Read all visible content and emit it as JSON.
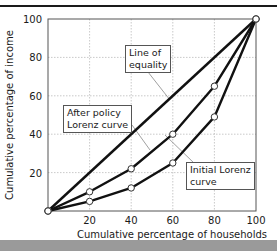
{
  "chart_data": {
    "type": "line",
    "title": "",
    "xlabel": "Cumulative percentage of households",
    "ylabel": "Cumulative percentage of income",
    "xlim": [
      0,
      100
    ],
    "ylim": [
      0,
      100
    ],
    "x_ticks": [
      "20",
      "40",
      "60",
      "80",
      "100"
    ],
    "y_ticks": [
      "20",
      "40",
      "60",
      "80",
      "100"
    ],
    "grid": true,
    "series": [
      {
        "name": "Line of equality",
        "x": [
          0,
          100
        ],
        "y": [
          0,
          100
        ]
      },
      {
        "name": "After policy Lorenz curve",
        "x": [
          0,
          20,
          40,
          60,
          80,
          100
        ],
        "y": [
          0,
          10,
          22,
          40,
          65,
          100
        ]
      },
      {
        "name": "Initial Lorenz curve",
        "x": [
          0,
          20,
          40,
          60,
          80,
          100
        ],
        "y": [
          0,
          5,
          12,
          25,
          49,
          100
        ]
      }
    ],
    "annotations": [
      {
        "text": "Line of equality",
        "points_to": "Line of equality"
      },
      {
        "text": "After policy Lorenz curve",
        "points_to": "After policy Lorenz curve"
      },
      {
        "text": "Initial Lorenz curve",
        "points_to": "Initial Lorenz curve"
      }
    ]
  },
  "labels": {
    "equality_line1": "Line of",
    "equality_line2": "equality",
    "after_line1": "After policy",
    "after_line2": "Lorenz curve",
    "initial_line1": "Initial Lorenz",
    "initial_line2": "curve"
  },
  "colors": {
    "line": "#111111",
    "grid": "#bbbbbb",
    "frame": "#555555",
    "band": "#9a9a9a"
  }
}
